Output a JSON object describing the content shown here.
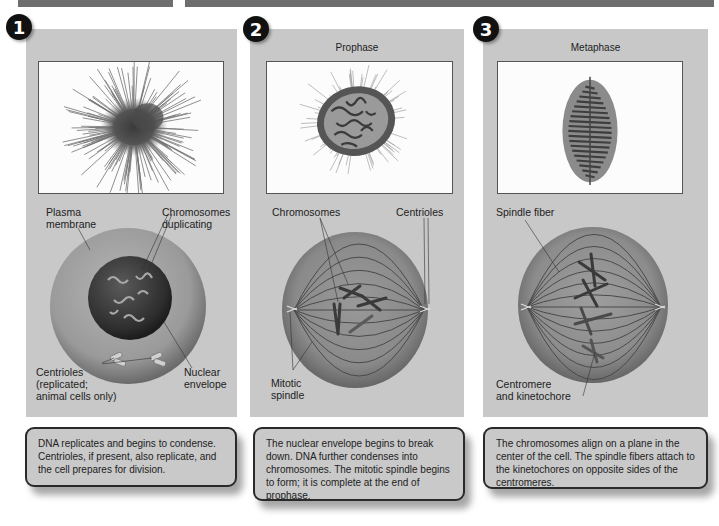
{
  "figure": {
    "colors": {
      "panel_bg": "#c8c8c8",
      "header_bar": "#6e6e6e",
      "badge_bg": "#111111",
      "cell_outer": "#9a9a9a",
      "nucleus": "#3a3a3a",
      "chromosome": "#4a4a4a"
    },
    "stages": [
      {
        "number": "1",
        "title": "",
        "micrograph": "interphase-cell-micrograph",
        "labels": {
          "plasma_membrane": "Plasma\nmembrane",
          "chromosomes": "Chromosomes\nduplicating",
          "centrioles": "Centrioles\n(replicated;\nanimal cells only)",
          "nuclear_envelope": "Nuclear\nenvelope"
        },
        "description": "DNA replicates and begins to condense. Centrioles, if present, also replicate, and the cell prepares for division."
      },
      {
        "number": "2",
        "title": "Prophase",
        "micrograph": "prophase-cell-micrograph",
        "labels": {
          "chromosomes": "Chromosomes",
          "centrioles": "Centrioles",
          "mitotic_spindle": "Mitotic\nspindle"
        },
        "description": "The nuclear envelope begins to break down. DNA further condenses into chromosomes. The mitotic spindle begins to form; it is complete at the end of prophase."
      },
      {
        "number": "3",
        "title": "Metaphase",
        "micrograph": "metaphase-cell-micrograph",
        "labels": {
          "spindle_fiber": "Spindle fiber",
          "centromere": "Centromere\nand kinetochore"
        },
        "description": "The chromosomes align on a plane in the center of the cell. The spindle fibers attach to the kinetochores on opposite sides of the centromeres."
      }
    ]
  }
}
